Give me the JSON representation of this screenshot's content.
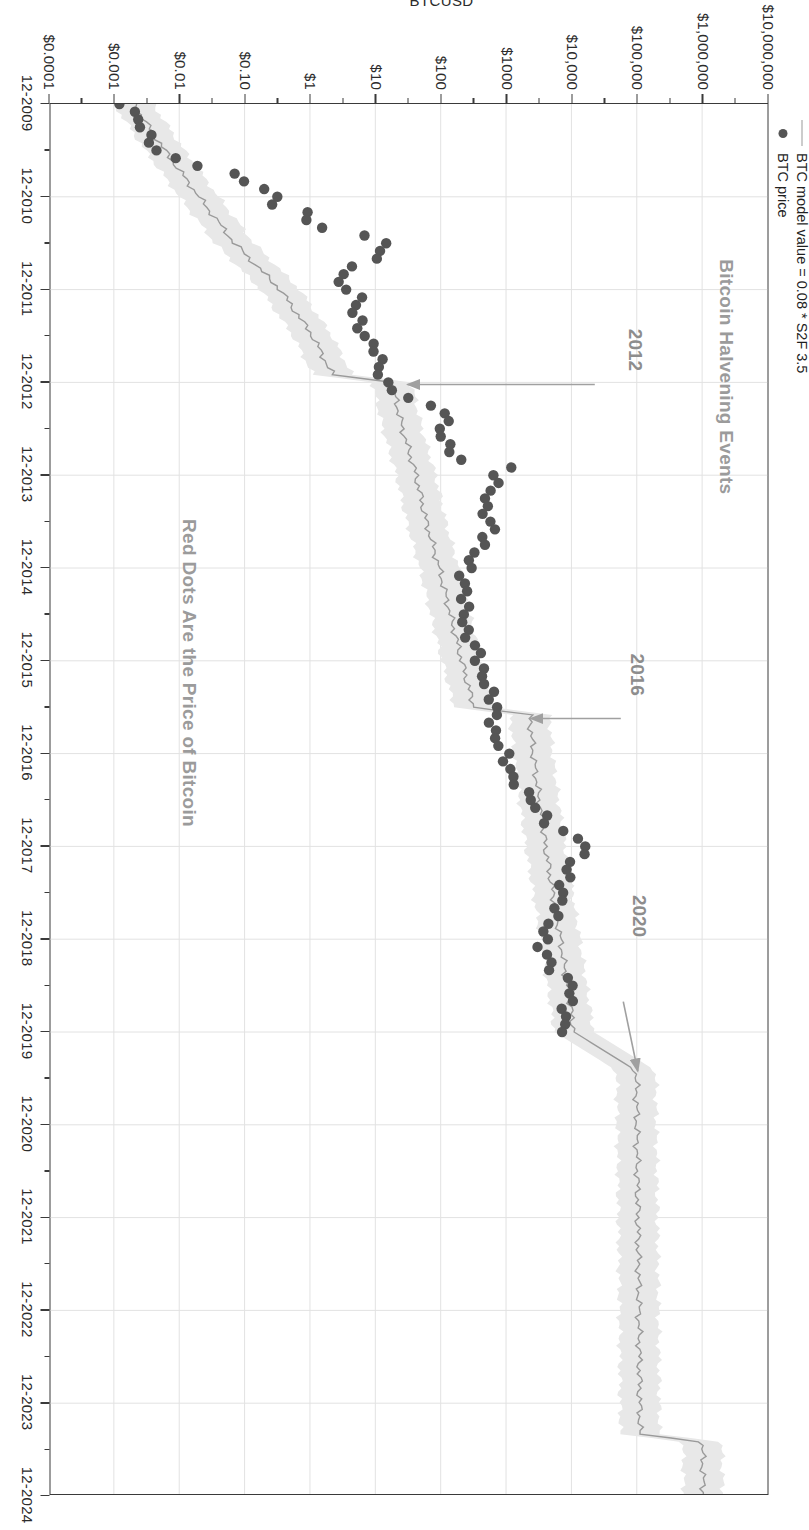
{
  "chart_data": {
    "type": "line",
    "title": "Bitcoin Halvening Events",
    "subtitle": "Red Dots Are the Price of Bitcoin",
    "xlabel": "",
    "ylabel": "BTCUSD",
    "orientation": "rotated-90-clockwise",
    "grid": true,
    "legend_position": "top-left",
    "yscale": "log",
    "ylim": [
      0.0001,
      10000000
    ],
    "xlim": [
      "12-2009",
      "12-2024"
    ],
    "x_ticks": [
      "12-2009",
      "12-2010",
      "12-2011",
      "12-2012",
      "12-2013",
      "12-2014",
      "12-2015",
      "12-2016",
      "12-2017",
      "12-2018",
      "12-2019",
      "12-2020",
      "12-2021",
      "12-2022",
      "12-2023",
      "12-2024"
    ],
    "y_ticks": [
      "$10,000,000",
      "$1,000,000",
      "$100,000",
      "$10,000",
      "$1000",
      "$100",
      "$10",
      "$1",
      "$0.10",
      "$0.01",
      "$0.001",
      "$0.0001"
    ],
    "y_tick_values": [
      10000000,
      1000000,
      100000,
      10000,
      1000,
      100,
      10,
      1,
      0.1,
      0.01,
      0.001,
      0.0001
    ],
    "series": [
      {
        "name": "BTC model value = 0.08 * S2F 3.5",
        "type": "line",
        "color": "#9a9a9a",
        "band": true,
        "band_color": "#e8e8e8",
        "points": [
          {
            "x": "12-2009",
            "y": 0.002
          },
          {
            "x": "06-2010",
            "y": 0.006
          },
          {
            "x": "12-2010",
            "y": 0.02
          },
          {
            "x": "06-2011",
            "y": 0.07
          },
          {
            "x": "12-2011",
            "y": 0.35
          },
          {
            "x": "06-2012",
            "y": 1.1
          },
          {
            "x": "11-2012",
            "y": 2.2
          },
          {
            "x": "12-2012",
            "y": 18
          },
          {
            "x": "06-2013",
            "y": 26
          },
          {
            "x": "12-2013",
            "y": 42
          },
          {
            "x": "06-2014",
            "y": 60
          },
          {
            "x": "12-2014",
            "y": 95
          },
          {
            "x": "06-2015",
            "y": 140
          },
          {
            "x": "12-2015",
            "y": 210
          },
          {
            "x": "06-2016",
            "y": 320
          },
          {
            "x": "07-2016",
            "y": 2300
          },
          {
            "x": "12-2016",
            "y": 2600
          },
          {
            "x": "06-2017",
            "y": 3200
          },
          {
            "x": "12-2017",
            "y": 4000
          },
          {
            "x": "06-2018",
            "y": 5200
          },
          {
            "x": "12-2018",
            "y": 6800
          },
          {
            "x": "06-2019",
            "y": 8600
          },
          {
            "x": "12-2019",
            "y": 11000
          },
          {
            "x": "05-2020",
            "y": 98000
          },
          {
            "x": "12-2020",
            "y": 100000
          },
          {
            "x": "12-2021",
            "y": 104000
          },
          {
            "x": "12-2022",
            "y": 108000
          },
          {
            "x": "04-2024",
            "y": 112000
          },
          {
            "x": "05-2024",
            "y": 1000000
          },
          {
            "x": "12-2024",
            "y": 1050000
          }
        ]
      },
      {
        "name": "BTC price",
        "type": "scatter",
        "color": "#555555",
        "points": [
          {
            "x": "11-2009",
            "y": 0.0011
          },
          {
            "x": "02-2010",
            "y": 0.0024
          },
          {
            "x": "04-2010",
            "y": 0.0032
          },
          {
            "x": "05-2010",
            "y": 0.0039
          },
          {
            "x": "06-2010",
            "y": 0.0044
          },
          {
            "x": "07-2010",
            "y": 0.008
          },
          {
            "x": "09-2010",
            "y": 0.062
          },
          {
            "x": "10-2010",
            "y": 0.1
          },
          {
            "x": "11-2010",
            "y": 0.22
          },
          {
            "x": "12-2010",
            "y": 0.27
          },
          {
            "x": "01-2011",
            "y": 0.3
          },
          {
            "x": "02-2011",
            "y": 0.9
          },
          {
            "x": "03-2011",
            "y": 0.8
          },
          {
            "x": "04-2011",
            "y": 1.8
          },
          {
            "x": "05-2011",
            "y": 6.0
          },
          {
            "x": "06-2011",
            "y": 15.0
          },
          {
            "x": "07-2011",
            "y": 13.0
          },
          {
            "x": "08-2011",
            "y": 9.0
          },
          {
            "x": "09-2011",
            "y": 5.0
          },
          {
            "x": "10-2011",
            "y": 3.2
          },
          {
            "x": "11-2011",
            "y": 2.5
          },
          {
            "x": "12-2011",
            "y": 4.2
          },
          {
            "x": "01-2012",
            "y": 5.5
          },
          {
            "x": "03-2012",
            "y": 4.9
          },
          {
            "x": "06-2012",
            "y": 6.7
          },
          {
            "x": "08-2012",
            "y": 11.0
          },
          {
            "x": "11-2012",
            "y": 12.0
          },
          {
            "x": "12-2012",
            "y": 13.5
          },
          {
            "x": "02-2013",
            "y": 31.0
          },
          {
            "x": "04-2013",
            "y": 135.0
          },
          {
            "x": "06-2013",
            "y": 100.0
          },
          {
            "x": "08-2013",
            "y": 120.0
          },
          {
            "x": "10-2013",
            "y": 200.0
          },
          {
            "x": "11-2013",
            "y": 1100.0
          },
          {
            "x": "12-2013",
            "y": 750.0
          },
          {
            "x": "02-2014",
            "y": 600.0
          },
          {
            "x": "04-2014",
            "y": 450.0
          },
          {
            "x": "07-2014",
            "y": 620.0
          },
          {
            "x": "10-2014",
            "y": 340.0
          },
          {
            "x": "01-2015",
            "y": 220.0
          },
          {
            "x": "04-2015",
            "y": 240.0
          },
          {
            "x": "08-2015",
            "y": 230.0
          },
          {
            "x": "11-2015",
            "y": 380.0
          },
          {
            "x": "01-2016",
            "y": 400.0
          },
          {
            "x": "06-2016",
            "y": 700.0
          },
          {
            "x": "09-2016",
            "y": 610.0
          },
          {
            "x": "12-2016",
            "y": 960.0
          },
          {
            "x": "03-2017",
            "y": 1200.0
          },
          {
            "x": "06-2017",
            "y": 2500.0
          },
          {
            "x": "09-2017",
            "y": 4400.0
          },
          {
            "x": "12-2017",
            "y": 19000.0
          },
          {
            "x": "02-2018",
            "y": 10000.0
          },
          {
            "x": "05-2018",
            "y": 7500.0
          },
          {
            "x": "08-2018",
            "y": 6400.0
          },
          {
            "x": "11-2018",
            "y": 4000.0
          },
          {
            "x": "01-2019",
            "y": 3500.0
          },
          {
            "x": "04-2019",
            "y": 5300.0
          },
          {
            "x": "06-2019",
            "y": 11000.0
          },
          {
            "x": "09-2019",
            "y": 8200.0
          },
          {
            "x": "11-2019",
            "y": 7500.0
          },
          {
            "x": "12-2019",
            "y": 7200.0
          }
        ]
      }
    ],
    "annotations": [
      {
        "label": "2012",
        "kind": "halving-event"
      },
      {
        "label": "2016",
        "kind": "halving-event"
      },
      {
        "label": "2020",
        "kind": "halving-event"
      }
    ]
  },
  "legend": {
    "model_label": "BTC model value = 0.08 * S2F 3.5",
    "price_label": "BTC price"
  },
  "titles": {
    "main": "Bitcoin Halvening Events",
    "note": "Red Dots Are the Price of Bitcoin",
    "y_axis": "BTCUSD"
  },
  "annotations": {
    "h2012": "2012",
    "h2016": "2016",
    "h2020": "2020"
  },
  "colors": {
    "model_line": "#9a9a9a",
    "model_band": "#e8e8e8",
    "price_dot": "#555555",
    "grid": "#e2e2e2",
    "axis": "#3a3a3a",
    "title_gray": "#9b9b9b"
  },
  "axes": {
    "x_ticks": [
      "12-2009",
      "12-2010",
      "12-2011",
      "12-2012",
      "12-2013",
      "12-2014",
      "12-2015",
      "12-2016",
      "12-2017",
      "12-2018",
      "12-2019",
      "12-2020",
      "12-2021",
      "12-2022",
      "12-2023",
      "12-2024"
    ],
    "y_ticks": [
      "$10,000,000",
      "$1,000,000",
      "$100,000",
      "$10,000",
      "$1000",
      "$100",
      "$10",
      "$1",
      "$0.10",
      "$0.01",
      "$0.001",
      "$0.0001"
    ]
  }
}
